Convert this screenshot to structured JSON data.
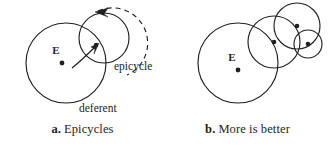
{
  "figure": {
    "panels": [
      {
        "id": "a",
        "caption_key": "a.",
        "caption_text": "Epicycles",
        "center_label": "E",
        "labels": {
          "epicycle": "epicycle",
          "deferent": "deferent"
        },
        "geometry": {
          "deferent": {
            "cx": 66,
            "cy": 63,
            "r": 40
          },
          "epicycle": {
            "cx": 104,
            "cy": 38,
            "r": 25
          },
          "earth_dot": {
            "cx": 62,
            "cy": 63,
            "r": 2.4
          },
          "earth_label": {
            "x": 56,
            "y": 54
          },
          "planet_dot": {
            "cx": 96,
            "cy": 45,
            "r": 2.2
          },
          "dashed_arc": "M 98 11 A 33 33 0 0 1 127 75",
          "radius_arrow": "M 72 68 C 82 60 90 52 97 45",
          "arrow_head_epicycle": "M 99 43 L 91 47 L 95 49 L 94 54 Z",
          "arrow_head_dashed": "M 95 12 L 108 8 L 104 14 L 108 17 Z",
          "epicycle_label": {
            "x": 114,
            "y": 70
          },
          "deferent_label": {
            "x": 79,
            "y": 112
          }
        },
        "colors": {
          "stroke": "#231f20"
        }
      },
      {
        "id": "b",
        "caption_key": "b.",
        "caption_text": "More is better",
        "center_label": "E",
        "labels": {},
        "geometry": {
          "deferent": {
            "cx": 73,
            "cy": 63,
            "r": 40
          },
          "earth_dot": {
            "cx": 73,
            "cy": 70,
            "r": 2.4
          },
          "earth_label": {
            "x": 67,
            "y": 61
          },
          "epicycles": [
            {
              "cx": 109,
              "cy": 42,
              "r": 26
            },
            {
              "cx": 132,
              "cy": 26,
              "r": 23
            },
            {
              "cx": 143,
              "cy": 44,
              "r": 14
            }
          ],
          "dots": [
            {
              "cx": 109,
              "cy": 42,
              "r": 2.3
            },
            {
              "cx": 132,
              "cy": 26,
              "r": 2.3
            },
            {
              "cx": 143,
              "cy": 44,
              "r": 2.3
            }
          ]
        },
        "colors": {
          "stroke": "#231f20"
        }
      }
    ]
  }
}
